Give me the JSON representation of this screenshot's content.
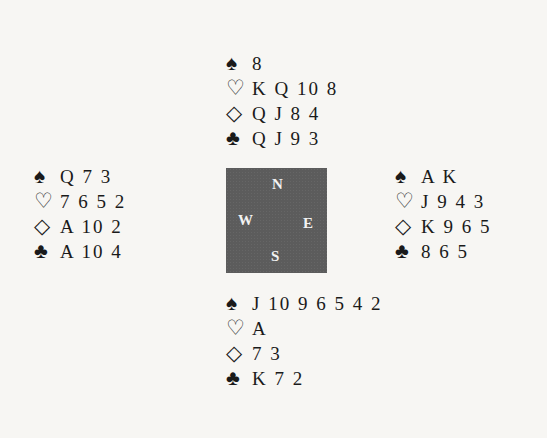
{
  "suits": {
    "spade": "♠",
    "heart": "♡",
    "diamond": "◇",
    "club": "♣"
  },
  "hands": {
    "north": {
      "spades": "8",
      "hearts": "K Q 10 8",
      "diamonds": "Q J 8 4",
      "clubs": "Q J 9 3"
    },
    "west": {
      "spades": "Q 7 3",
      "hearts": "7 6 5 2",
      "diamonds": "A 10 2",
      "clubs": "A 10 4"
    },
    "east": {
      "spades": "A K",
      "hearts": "J 9 4 3",
      "diamonds": "K 9 6 5",
      "clubs": "8 6 5"
    },
    "south": {
      "spades": "J 10 9 6 5 4 2",
      "hearts": "A",
      "diamonds": "7 3",
      "clubs": "K 7 2"
    }
  },
  "compass": {
    "n": "N",
    "w": "W",
    "e": "E",
    "s": "S",
    "color": "#5c5c5c"
  }
}
